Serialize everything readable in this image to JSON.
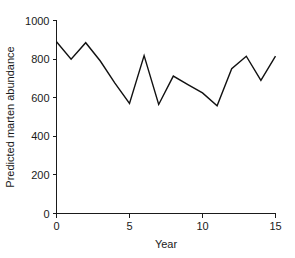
{
  "chart_data": {
    "type": "line",
    "title": "",
    "xlabel": "Year",
    "ylabel": "Predicted marten abundance",
    "x": [
      0,
      1,
      2,
      3,
      4,
      5,
      6,
      7,
      8,
      9,
      10,
      11,
      12,
      13,
      14,
      15
    ],
    "values": [
      890,
      800,
      885,
      790,
      675,
      570,
      818,
      565,
      712,
      668,
      625,
      558,
      750,
      815,
      690,
      815
    ],
    "series": [
      {
        "name": "Predicted marten abundance",
        "values": [
          890,
          800,
          885,
          790,
          675,
          570,
          818,
          565,
          712,
          668,
          625,
          558,
          750,
          815,
          690,
          815
        ]
      }
    ],
    "xlim": [
      0,
      15
    ],
    "ylim": [
      0,
      1000
    ],
    "xticks": [
      0,
      5,
      10,
      15
    ],
    "yticks": [
      0,
      200,
      400,
      600,
      800,
      1000
    ],
    "xtick_labels": [
      "0",
      "5",
      "10",
      "15"
    ],
    "ytick_labels": [
      "0",
      "200",
      "400",
      "600",
      "800",
      "1000"
    ],
    "grid": false,
    "legend": false,
    "legend_position": "none",
    "line_color": "#111111",
    "axis_color": "#1a1a1a",
    "background_color": "#ffffff"
  }
}
